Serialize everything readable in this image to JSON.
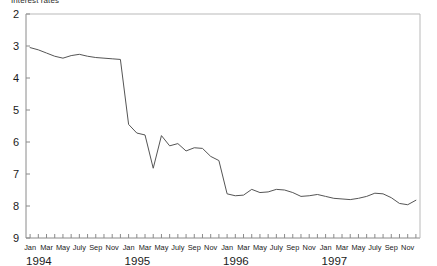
{
  "chart_data": {
    "type": "line",
    "title": "Interest rates",
    "xlabel": "",
    "ylabel": "",
    "ylim": [
      2,
      9
    ],
    "y_inverted": true,
    "grid": false,
    "legend": false,
    "yticks": [
      "2",
      "3",
      "4",
      "5",
      "6",
      "7",
      "8",
      "9"
    ],
    "ytick_values": [
      2,
      3,
      4,
      5,
      6,
      7,
      8,
      9
    ],
    "year_labels": [
      "1994",
      "1995",
      "1996",
      "1997"
    ],
    "month_tick_labels": [
      "Jan",
      "Mar",
      "May",
      "July",
      "Sep",
      "Nov",
      "Jan",
      "Mar",
      "May",
      "July",
      "Sep",
      "Nov",
      "Jan",
      "Mar",
      "May",
      "July",
      "Sep",
      "Nov",
      "Jan",
      "Mar",
      "May",
      "July",
      "Sep",
      "Nov"
    ],
    "x": [
      "1994-01",
      "1994-02",
      "1994-03",
      "1994-04",
      "1994-05",
      "1994-06",
      "1994-07",
      "1994-08",
      "1994-09",
      "1994-10",
      "1994-11",
      "1994-12",
      "1995-01",
      "1995-02",
      "1995-03",
      "1995-04",
      "1995-05",
      "1995-06",
      "1995-07",
      "1995-08",
      "1995-09",
      "1995-10",
      "1995-11",
      "1995-12",
      "1996-01",
      "1996-02",
      "1996-03",
      "1996-04",
      "1996-05",
      "1996-06",
      "1996-07",
      "1996-08",
      "1996-09",
      "1996-10",
      "1996-11",
      "1996-12",
      "1997-01",
      "1997-02",
      "1997-03",
      "1997-04",
      "1997-05",
      "1997-06",
      "1997-07",
      "1997-08",
      "1997-09",
      "1997-10",
      "1997-11",
      "1997-12"
    ],
    "values": [
      3.05,
      3.12,
      3.22,
      3.32,
      3.38,
      3.3,
      3.26,
      3.32,
      3.36,
      3.38,
      3.4,
      3.42,
      5.45,
      5.72,
      5.78,
      6.82,
      5.8,
      6.12,
      6.05,
      6.28,
      6.18,
      6.2,
      6.45,
      6.58,
      7.62,
      7.68,
      7.66,
      7.48,
      7.58,
      7.56,
      7.48,
      7.5,
      7.58,
      7.7,
      7.68,
      7.64,
      7.7,
      7.76,
      7.78,
      7.8,
      7.76,
      7.7,
      7.6,
      7.62,
      7.74,
      7.92,
      7.96,
      7.82
    ],
    "line_color": "#555555",
    "axis_color": "#888888",
    "background": "#ffffff"
  }
}
